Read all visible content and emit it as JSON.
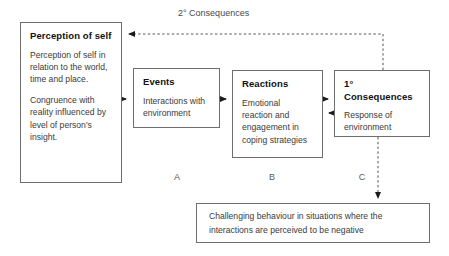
{
  "diagram": {
    "title_label": "2° Consequences",
    "background_color": "#ffffff",
    "border_color": "#6e6e6e",
    "text_color": "#3a3a3a"
  },
  "boxes": {
    "perception": {
      "title": "Perception of self",
      "paragraphs": [
        "Perception of self in relation to the world, time and place.",
        "Congruence with reality influenced by level of person's insight."
      ]
    },
    "events": {
      "title": "Events",
      "body": "Interactions with environment"
    },
    "reactions": {
      "title": "Reactions",
      "body": "Emotional reaction and engagement in coping strategies"
    },
    "consequences": {
      "title_prefix": "1°",
      "title": "Consequences",
      "body": "Response of environment"
    },
    "challenging": {
      "body": "Challenging behaviour in situations where the interactions are perceived to be negative"
    }
  },
  "captions": {
    "a": "A",
    "b": "B",
    "c": "C"
  }
}
